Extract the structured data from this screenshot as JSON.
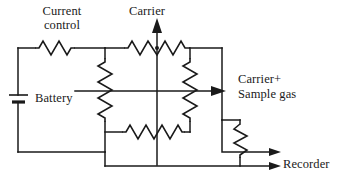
{
  "diagram": {
    "labels": {
      "current_control_line1": "Current",
      "current_control_line2": "control",
      "carrier": "Carrier",
      "carrier_sample_line1": "Carrier+",
      "carrier_sample_line2": "Sample gas",
      "battery": "Battery",
      "recorder": "Recorder"
    },
    "components": {
      "current_control_resistor": "Current control resistor",
      "battery_cell": "Battery cell",
      "bridge_resistor_top": "Top bridge filament",
      "bridge_resistor_left": "Left bridge filament",
      "bridge_resistor_right": "Right bridge filament",
      "bridge_resistor_bottom": "Bottom bridge filament",
      "recorder_resistor": "Recorder output resistor",
      "carrier_flow_arrow": "Carrier gas inlet arrow",
      "sample_flow_arrow": "Carrier plus sample gas outlet arrow",
      "recorder_arrow_upper": "Recorder signal arrow upper",
      "recorder_arrow_lower": "Recorder signal arrow lower"
    },
    "colors": {
      "ink": "#1a1a1a",
      "background": "#ffffff"
    }
  }
}
